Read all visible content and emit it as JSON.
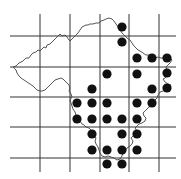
{
  "map": {
    "type": "distribution-grid-map",
    "width": 181,
    "height": 179,
    "colors": {
      "background": "#ffffff",
      "grid": "#333333",
      "outline": "#444444",
      "dot": "#111111"
    },
    "grid": {
      "vertical_x": [
        40,
        70,
        100,
        129,
        159
      ],
      "horizontal_y": [
        36,
        67,
        97,
        127,
        158
      ],
      "x_extent": [
        10,
        176
      ],
      "y_extent": [
        14,
        172
      ]
    },
    "dot_radius": 4.6,
    "dots": [
      [
        122,
        27
      ],
      [
        122,
        42
      ],
      [
        137,
        58
      ],
      [
        152,
        58
      ],
      [
        167,
        58
      ],
      [
        107,
        74
      ],
      [
        137,
        74
      ],
      [
        167,
        73
      ],
      [
        92,
        89
      ],
      [
        152,
        89
      ],
      [
        167,
        88
      ],
      [
        77,
        103
      ],
      [
        92,
        103
      ],
      [
        107,
        103
      ],
      [
        137,
        103
      ],
      [
        152,
        103
      ],
      [
        77,
        119
      ],
      [
        92,
        119
      ],
      [
        107,
        119
      ],
      [
        122,
        119
      ],
      [
        137,
        119
      ],
      [
        92,
        134
      ],
      [
        122,
        134
      ],
      [
        137,
        134
      ],
      [
        92,
        150
      ],
      [
        107,
        150
      ],
      [
        122,
        150
      ],
      [
        137,
        150
      ],
      [
        107,
        164
      ],
      [
        122,
        164
      ]
    ],
    "outline_path": "M13,67 L16,66 L19,63 L23,61 L26,58 L29,58 L31,55 L33,53 L36,52 L38,50 L40,51 L42,49 L44,47 L46,48 L47,45 L50,44 L52,42 L54,40 L56,38 L58,36 L60,34 L62,36 L65,35 L67,37 L69,40 L70,41 L72,39 L74,37 L76,35 L78,33 L80,30 L82,27 L84,26 L86,25 L88,25 L90,24 L93,24 L96,23 L99,23 L101,21 L104,20 L106,19 L109,18 L112,19 L114,21 L116,24 L118,27 L120,30 L122,33 L125,36 L127,38 L130,40 L132,43 L134,46 L136,48 L138,50 L140,51 L143,53 L146,55 L149,55 L152,57 L155,58 L158,57 L161,58 L164,58 L167,57 L170,58 L172,60 L170,63 L168,65 L166,67 L167,70 L168,73 L167,76 L165,78 L163,79 L165,82 L168,84 L171,85 L169,88 L166,90 L163,91 L160,92 L158,95 L157,98 L155,100 L153,103 L151,106 L149,107 L147,109 L145,111 L143,113 L144,116 L146,118 L145,121 L142,123 L139,124 L137,126 L135,128 L137,131 L136,134 L133,136 L131,138 L133,141 L132,144 L130,146 L127,148 L125,151 L123,153 L122,156 L120,159 L117,160 L114,158 L111,157 L108,156 L105,157 L102,156 L100,153 L99,150 L98,147 L96,144 L95,141 L96,138 L94,135 L93,132 L91,130 L89,128 L86,127 L84,125 L82,124 L80,121 L78,118 L76,115 L75,112 L73,109 L72,106 L71,103 L70,100 L72,97 L71,94 L69,91 L70,88 L69,85 L67,83 L65,81 L63,79 L61,78 L58,79 L55,80 L53,82 L51,84 L49,86 L47,88 L45,90 L42,91 L40,91 L37,90 L35,88 L33,86 L30,84 L27,82 L24,80 L21,78 L19,76 L17,73 L16,70 Z"
  }
}
